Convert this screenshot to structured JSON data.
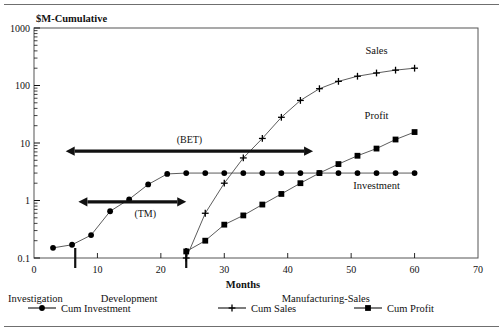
{
  "chart_data": {
    "type": "line",
    "title": "$M-Cumulative",
    "xlabel": "Months",
    "ylabel": "$M-Cumulative",
    "xlim": [
      0,
      70
    ],
    "ylim": [
      0.1,
      1000
    ],
    "yscale": "log",
    "grid": false,
    "legend_position": "bottom",
    "xticks": [
      0,
      10,
      20,
      30,
      40,
      50,
      60,
      70
    ],
    "xtick_labels": [
      "0",
      "10",
      "20",
      "30",
      "40",
      "50",
      "60",
      "70"
    ],
    "yticks": [
      0.1,
      1,
      10,
      100,
      1000
    ],
    "ytick_labels": [
      "0.1",
      "1",
      "10",
      "100",
      "1000"
    ],
    "series": [
      {
        "name": "Cum Investment",
        "marker": "filled-circle",
        "label": "Investment",
        "x": [
          3,
          6,
          9,
          12,
          15,
          18,
          21,
          24,
          27,
          30,
          33,
          36,
          39,
          42,
          45,
          48,
          51,
          54,
          57,
          60
        ],
        "y": [
          0.15,
          0.17,
          0.25,
          0.65,
          1.05,
          1.9,
          2.9,
          3.0,
          3.0,
          3.0,
          3.0,
          3.0,
          3.0,
          3.0,
          3.0,
          3.0,
          3.0,
          3.0,
          3.0,
          3.0
        ]
      },
      {
        "name": "Cum Sales",
        "marker": "plus",
        "label": "Sales",
        "x": [
          24,
          27,
          30,
          33,
          36,
          39,
          42,
          45,
          48,
          51,
          54,
          57,
          60
        ],
        "y": [
          0.1,
          0.6,
          2.0,
          5.5,
          12.0,
          28.0,
          55.0,
          88.0,
          118.0,
          145.0,
          165.0,
          185.0,
          200.0
        ]
      },
      {
        "name": "Cum Profit",
        "marker": "filled-square",
        "label": "Profit",
        "x": [
          24,
          27,
          30,
          33,
          36,
          39,
          42,
          45,
          48,
          51,
          54,
          57,
          60
        ],
        "y": [
          0.13,
          0.2,
          0.38,
          0.55,
          0.85,
          1.3,
          2.0,
          3.0,
          4.3,
          6.0,
          8.0,
          11.5,
          15.5
        ]
      }
    ],
    "annotations": [
      {
        "id": "bet",
        "label": "(BET)",
        "type": "double-arrow",
        "x_start": 5.0,
        "x_end": 44.0,
        "y": 7.2
      },
      {
        "id": "tm",
        "label": "(TM)",
        "type": "double-arrow",
        "x_start": 7.0,
        "x_end": 24.0,
        "y": 0.95
      }
    ],
    "phase_dividers": [
      6.5,
      24.0
    ],
    "phases": [
      {
        "label": "Investigation",
        "x": 3.0
      },
      {
        "label": "Development",
        "x": 15.0
      },
      {
        "label": "Manufacturing-Sales",
        "x": 46.0
      }
    ]
  },
  "legend": {
    "items": [
      {
        "label": "Cum Investment",
        "marker": "filled-circle"
      },
      {
        "label": "Cum Sales",
        "marker": "plus"
      },
      {
        "label": "Cum Profit",
        "marker": "filled-square"
      }
    ]
  },
  "colors": {
    "ink": "#111111",
    "rule": "#6f6f6f",
    "frame": "#555555",
    "curve": "#4a4a4a",
    "marker": "#000000"
  }
}
